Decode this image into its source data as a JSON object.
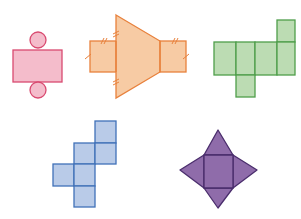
{
  "diagram": {
    "nets": [
      {
        "id": "cylinder-net",
        "solid": "cylinder",
        "fill": "#f4bccb",
        "stroke": "#d94a70"
      },
      {
        "id": "triangular-prism-net",
        "solid": "triangular prism",
        "fill": "#f7cba4",
        "stroke": "#e8813c",
        "tick_marks": [
          "single",
          "double"
        ]
      },
      {
        "id": "green-cube-net",
        "solid": "cube-like prism",
        "fill": "#bcdcb3",
        "stroke": "#4f9e4b",
        "cells": 6
      },
      {
        "id": "blue-cube-net",
        "solid": "cube",
        "fill": "#b9cbe8",
        "stroke": "#4071b8",
        "cells": 6
      },
      {
        "id": "square-pyramid-net",
        "solid": "square pyramid",
        "fill": "#8f6caa",
        "stroke": "#4a2d6c"
      }
    ]
  }
}
